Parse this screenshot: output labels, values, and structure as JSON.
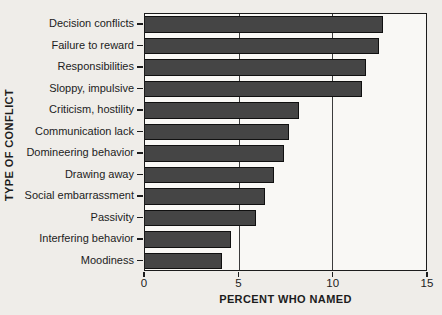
{
  "colors": {
    "page_background": "#efede9",
    "plot_background": "#f9f8f5",
    "bar_fill": "#454545",
    "bar_border": "#101010",
    "grid_color": "#3c3c3c",
    "axis_color": "#1c1c1c",
    "text_color": "#1c1c1c"
  },
  "chart_data": {
    "type": "bar",
    "orientation": "horizontal",
    "title": "",
    "xlabel": "PERCENT WHO NAMED",
    "ylabel": "TYPE OF CONFLICT",
    "categories": [
      "Decision conflicts",
      "Failure to reward",
      "Responsibilities",
      "Sloppy, impulsive",
      "Criticism, hostility",
      "Communication lack",
      "Domineering behavior",
      "Drawing away",
      "Social embarrassment",
      "Passivity",
      "Interfering behavior",
      "Moodiness"
    ],
    "values": [
      12.7,
      12.5,
      11.8,
      11.6,
      8.2,
      7.7,
      7.4,
      6.9,
      6.4,
      5.9,
      4.6,
      4.1
    ],
    "xlim": [
      0,
      15
    ],
    "xticks": [
      0,
      5,
      10,
      15
    ],
    "xtick_labels": [
      "0",
      "5",
      "10",
      "15"
    ],
    "gridlines_x": [
      5,
      10
    ],
    "grid": true,
    "legend": false
  }
}
